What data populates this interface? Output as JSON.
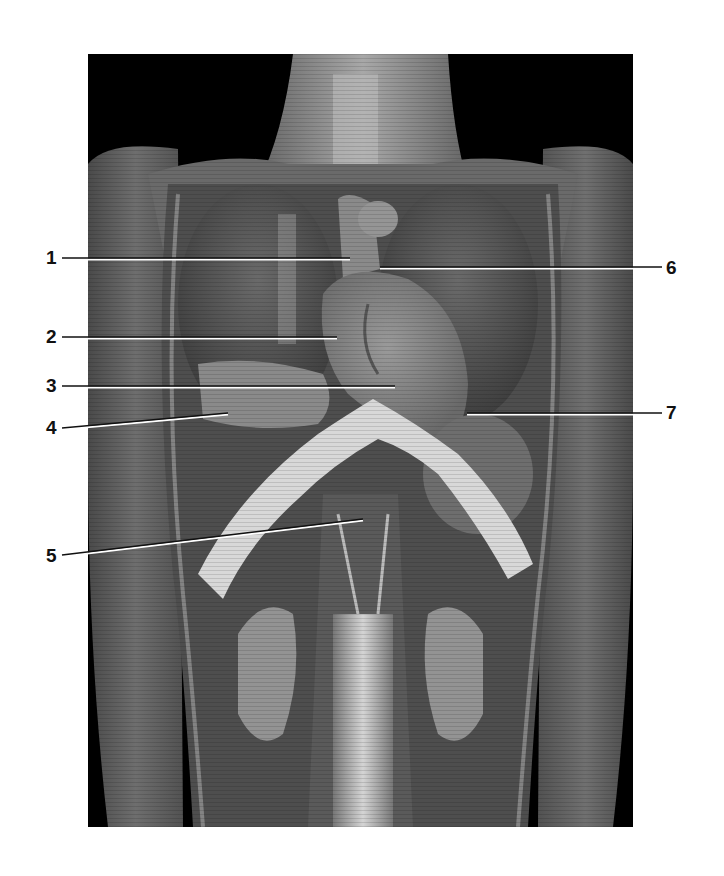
{
  "figure": {
    "type": "labeled-anatomical-photograph",
    "view": "anterior thorax and abdomen dissection",
    "colors": {
      "background": "#ffffff",
      "photo_background": "#000000",
      "label_text": "#111111",
      "leader_line": "#111111",
      "leader_line_highlight": "#ffffff"
    },
    "labels": [
      {
        "id": "1",
        "text": "1",
        "side": "left",
        "label_x": 46,
        "label_y": 248,
        "line": {
          "x1": 62,
          "y1": 258,
          "x2": 350,
          "y2": 258
        }
      },
      {
        "id": "2",
        "text": "2",
        "side": "left",
        "label_x": 46,
        "label_y": 327,
        "line": {
          "x1": 62,
          "y1": 337,
          "x2": 337,
          "y2": 337
        }
      },
      {
        "id": "3",
        "text": "3",
        "side": "left",
        "label_x": 46,
        "label_y": 376,
        "line": {
          "x1": 62,
          "y1": 386,
          "x2": 395,
          "y2": 386
        }
      },
      {
        "id": "4",
        "text": "4",
        "side": "left",
        "label_x": 46,
        "label_y": 418,
        "line": {
          "x1": 62,
          "y1": 428,
          "x2": 228,
          "y2": 413
        }
      },
      {
        "id": "5",
        "text": "5",
        "side": "left",
        "label_x": 46,
        "label_y": 546,
        "line": {
          "x1": 62,
          "y1": 555,
          "x2": 363,
          "y2": 519
        }
      },
      {
        "id": "6",
        "text": "6",
        "side": "right",
        "label_x": 666,
        "label_y": 258,
        "line": {
          "x1": 380,
          "y1": 267,
          "x2": 662,
          "y2": 267
        }
      },
      {
        "id": "7",
        "text": "7",
        "side": "right",
        "label_x": 666,
        "label_y": 403,
        "line": {
          "x1": 467,
          "y1": 413,
          "x2": 662,
          "y2": 413
        }
      }
    ]
  }
}
